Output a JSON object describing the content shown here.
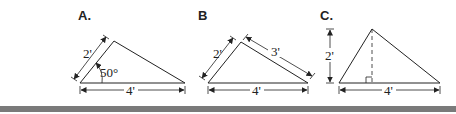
{
  "figures": [
    {
      "label": "A.",
      "dims": {
        "side": "2'",
        "angle": "50°",
        "base": "4'"
      }
    },
    {
      "label": "B",
      "dims": {
        "left": "2'",
        "right": "3'",
        "base": "4'"
      }
    },
    {
      "label": "C.",
      "dims": {
        "height": "2'",
        "base": "4'"
      }
    }
  ],
  "colors": {
    "line": "#222222",
    "bar": "#7a7a7a",
    "background": "#ffffff"
  }
}
